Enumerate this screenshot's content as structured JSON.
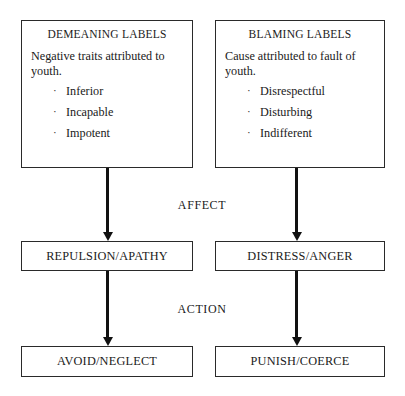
{
  "diagram": {
    "columns": [
      {
        "id": "demeaning",
        "source_box": {
          "title": "DEMEANING LABELS",
          "description": "Negative traits attributed to youth.",
          "bullets": [
            "Inferior",
            "Incapable",
            "Impotent"
          ],
          "bullet_glyph": "·"
        },
        "affect_box": {
          "label": "REPULSION/APATHY"
        },
        "action_box": {
          "label": "AVOID/NEGLECT"
        }
      },
      {
        "id": "blaming",
        "source_box": {
          "title": "BLAMING LABELS",
          "description": "Cause attributed to fault of youth.",
          "bullets": [
            "Disrespectful",
            "Disturbing",
            "Indifferent"
          ],
          "bullet_glyph": "·"
        },
        "affect_box": {
          "label": "DISTRESS/ANGER"
        },
        "action_box": {
          "label": "PUNISH/COERCE"
        }
      }
    ],
    "stage_labels": {
      "affect": "AFFECT",
      "action": "ACTION"
    },
    "colors": {
      "background": "#ffffff",
      "box_border": "#2a2a2a",
      "arrow": "#111111",
      "text": "#1a1a1a"
    }
  }
}
